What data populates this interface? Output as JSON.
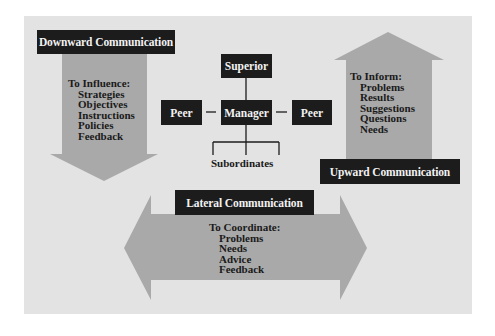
{
  "diagram": {
    "colors": {
      "background": "#e3e3e3",
      "arrow_fill": "#a9a9a9",
      "label_box": "#1c1c1c",
      "label_text": "#f2f2f2",
      "body_text": "#1a1a1a"
    },
    "downward": {
      "label": "Downward Communication",
      "heading": "To Influence:",
      "items": [
        "Strategies",
        "Objectives",
        "Instructions",
        "Policies",
        "Feedback"
      ]
    },
    "upward": {
      "label": "Upward Communication",
      "heading": "To Inform:",
      "items": [
        "Problems",
        "Results",
        "Suggestions",
        "Questions",
        "Needs"
      ]
    },
    "lateral": {
      "label": "Lateral Communication",
      "heading": "To Coordinate:",
      "items": [
        "Problems",
        "Needs",
        "Advice",
        "Feedback"
      ]
    },
    "org_chart": {
      "superior": "Superior",
      "manager": "Manager",
      "peer_left": "Peer",
      "peer_right": "Peer",
      "subordinates": "Subordinates"
    }
  }
}
